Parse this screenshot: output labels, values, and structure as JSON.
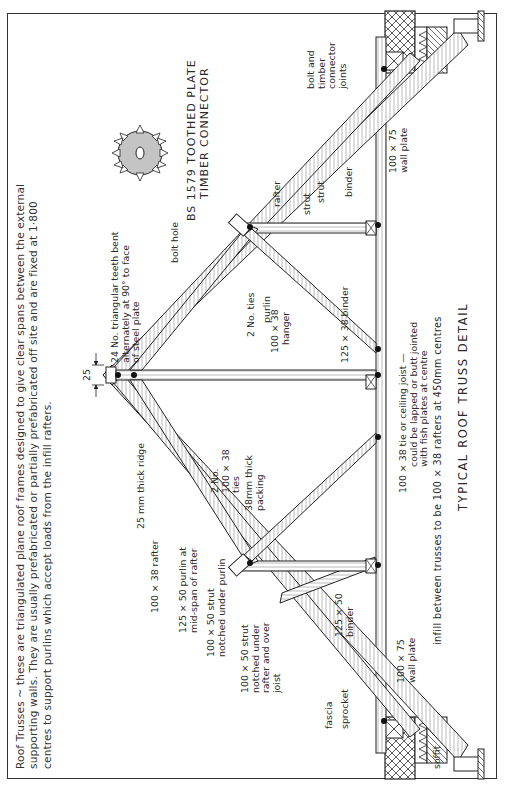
{
  "intro": {
    "line1": "Roof Trusses ~ these are triangulated plane roof frames designed to give clear spans between the external",
    "line2": "supporting walls. They are usually prefabricated or partially prefabricated off site and are fixed at 1·800",
    "line3": "centres to support purlins which accept loads from the infill rafters."
  },
  "connector": {
    "title_line1": "BS 1579 TOOTHED PLATE",
    "title_line2": "TIMBER CONNECTOR",
    "teeth_note_line1": "24 No. triangular teeth bent",
    "teeth_note_line2": "alternately at 90° to face",
    "teeth_note_line3": "of steel plate",
    "bolt_hole": "bolt hole"
  },
  "dimension": {
    "ridge_gap": "25"
  },
  "labels": {
    "ridge": "25 mm thick ridge",
    "rafter_main": "100 × 38  rafter",
    "purlin_line1": "125 × 50  purlin at",
    "purlin_line2": "mid-span  of rafter",
    "strut_purlin_line1": "100 × 50  strut",
    "strut_purlin_line2": "notched  under purlin",
    "strut_joist_line1": "100 × 50  strut",
    "strut_joist_line2": "notched  under",
    "strut_joist_line3": "rafter and over",
    "strut_joist_line4": "joist",
    "fascia": "fascia",
    "sprocket": "sprocket",
    "soffit": "soffit",
    "binder_left_line1": "125 × 50",
    "binder_left_line2": "binder",
    "wall_plate_left_line1": "100 × 75",
    "wall_plate_left_line2": "wall plate",
    "ties_left_line1": "2 No.",
    "ties_left_line2": "100 × 38",
    "ties_left_line3": "ties",
    "packing_line1": "38mm thick",
    "packing_line2": "packing",
    "tie_joist_line1": "100 × 38  tie  or  ceiling  joist —",
    "tie_joist_line2": "could  be  lapped  or  butt  jointed",
    "tie_joist_line3": "with  fish  plates  at  centre",
    "ties_right": "2 No. ties",
    "purlin_right": "purlin",
    "hanger_line1": "100 × 38",
    "hanger_line2": "hanger",
    "binder_centre": "125 × 38  binder",
    "rafter_right": "rafter",
    "strut_right_upper": "strut",
    "strut_right_lower": "strut",
    "binder_right": "binder",
    "bolt_joints_line1": "bolt and",
    "bolt_joints_line2": "timber",
    "bolt_joints_line3": "connector",
    "bolt_joints_line4": "joints",
    "wall_plate_right_line1": "100 × 75",
    "wall_plate_right_line2": "wall plate"
  },
  "footer": {
    "infill_note": "infill  between  trusses  to  be  100 × 38  rafters  at  450mm  centres",
    "title": "TYPICAL  ROOF  TRUSS  DETAIL"
  }
}
